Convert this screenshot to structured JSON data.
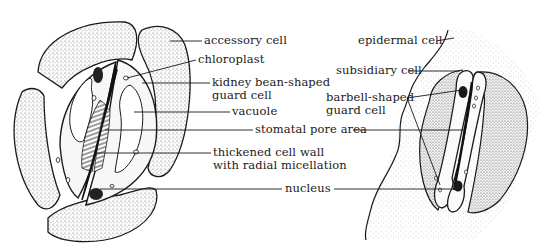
{
  "diagram": {
    "left_figure": {
      "name": "kidney-shaped stoma",
      "labels": {
        "accessory_cell": "accessory cell",
        "chloroplast": "chloroplast",
        "guard_cell_line1": "kidney bean-shaped",
        "guard_cell_line2": "guard cell",
        "vacuole": "vacuole",
        "thickened_wall_line1": "thickened cell wall",
        "thickened_wall_line2": "with radial micellation",
        "nucleus": "nucleus"
      }
    },
    "shared_labels": {
      "stomatal_pore_area": "stomatal pore area"
    },
    "right_figure": {
      "name": "barbell-shaped stoma",
      "labels": {
        "epidermal_cell": "epidermal cell",
        "subsidiary_cell": "subsidiary cell",
        "guard_cell_line1": "barbell-shaped",
        "guard_cell_line2": "guard cell"
      }
    },
    "colors": {
      "ink": "#1a1a1a",
      "stipple": "#cfcfcf",
      "background": "#ffffff"
    }
  }
}
